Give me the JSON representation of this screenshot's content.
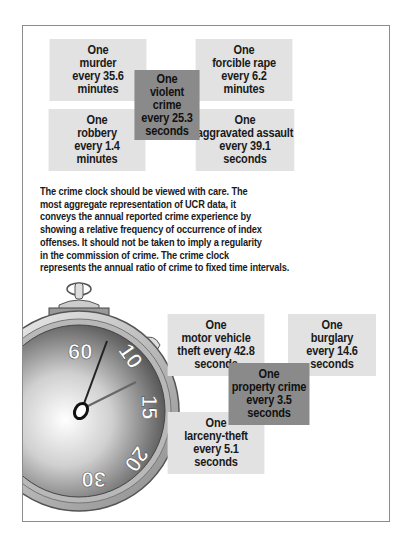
{
  "violent": {
    "murder": {
      "lines": [
        "One",
        "murder",
        "every 35.6",
        "minutes"
      ]
    },
    "forcible_rape": {
      "lines": [
        "One",
        "forcible rape",
        "every 6.2",
        "minutes"
      ]
    },
    "total": {
      "lines": [
        "One",
        "violent",
        "crime",
        "every 25.3",
        "seconds"
      ]
    },
    "robbery": {
      "lines": [
        "One",
        "robbery",
        "every 1.4",
        "minutes"
      ]
    },
    "aggravated_assault": {
      "lines": [
        "One",
        "aggravated assault",
        "every 39.1",
        "seconds"
      ]
    }
  },
  "description": {
    "lines": [
      "The crime clock should be viewed with care. The",
      "most aggregate representation of UCR data, it",
      "conveys the annual reported crime experience by",
      "showing a relative frequency of occurrence of index",
      "offenses. It should not be taken to imply a regularity",
      "in the commission of crime. The crime clock",
      "represents the annual ratio of crime to fixed time intervals."
    ]
  },
  "stopwatch": {
    "icon": "stopwatch-icon",
    "dial_labels": [
      "60",
      "10",
      "15",
      "20",
      "30"
    ]
  },
  "property": {
    "motor_vehicle_theft": {
      "lines": [
        "One",
        "motor vehicle",
        "theft every 42.8",
        "seconds"
      ]
    },
    "burglary": {
      "lines": [
        "One",
        "burglary",
        "every 14.6",
        "seconds"
      ]
    },
    "total": {
      "lines": [
        "One",
        "property crime",
        "every 3.5",
        "seconds"
      ]
    },
    "larceny_theft": {
      "lines": [
        "One",
        "larceny-theft",
        "every 5.1",
        "seconds"
      ]
    }
  },
  "colors": {
    "box_light": "#e2e2e2",
    "box_dark": "#8a8a8a",
    "frame_border": "#8c8c8c"
  }
}
